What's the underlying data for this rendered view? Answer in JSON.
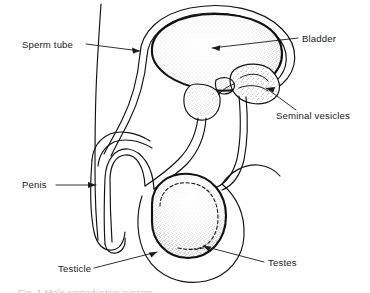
{
  "figure": {
    "title": "Male reproductive system",
    "style": "black and white line drawing, stippled shading",
    "background_color": "#ffffff",
    "line_color": "#111111",
    "text_color": "#1a1a1a",
    "width": 370,
    "height": 293
  },
  "labels": [
    {
      "id": "sperm-tube",
      "text": "Sperm tube",
      "text_x": 22,
      "text_y": 48,
      "anchor": "start",
      "leader": "M 86 44 L 140 51",
      "arrow_at": [
        140,
        51
      ],
      "arrow_angle": 7.5
    },
    {
      "id": "bladder",
      "text": "Bladder",
      "text_x": 302,
      "text_y": 42,
      "anchor": "start",
      "leader": "M 298 38 L 212 48",
      "arrow_at": [
        212,
        48
      ],
      "arrow_angle": 186.5
    },
    {
      "id": "seminal-vesicles",
      "text": "Seminal vesicles",
      "text_x": 276,
      "text_y": 119,
      "anchor": "start",
      "leader": "M 296 110 L 266 88",
      "arrow_at": [
        266,
        88
      ],
      "arrow_angle": 216
    },
    {
      "id": "penis",
      "text": "Penis",
      "text_x": 22,
      "text_y": 188,
      "anchor": "start",
      "leader": "M 56 185 L 96 185",
      "arrow_at": [
        96,
        185
      ],
      "arrow_angle": 0
    },
    {
      "id": "testicle",
      "text": "Testicle",
      "text_x": 58,
      "text_y": 272,
      "anchor": "start",
      "leader": "M 94 268 L 157 252",
      "arrow_at": [
        157,
        252
      ],
      "arrow_angle": -14
    },
    {
      "id": "testes",
      "text": "Testes",
      "text_x": 268,
      "text_y": 266,
      "anchor": "start",
      "leader": "M 264 262 L 203 246",
      "arrow_at": [
        203,
        246
      ],
      "arrow_angle": 194
    }
  ],
  "caption": {
    "clipped_text": "Fig. 1  Male reproductive system"
  }
}
